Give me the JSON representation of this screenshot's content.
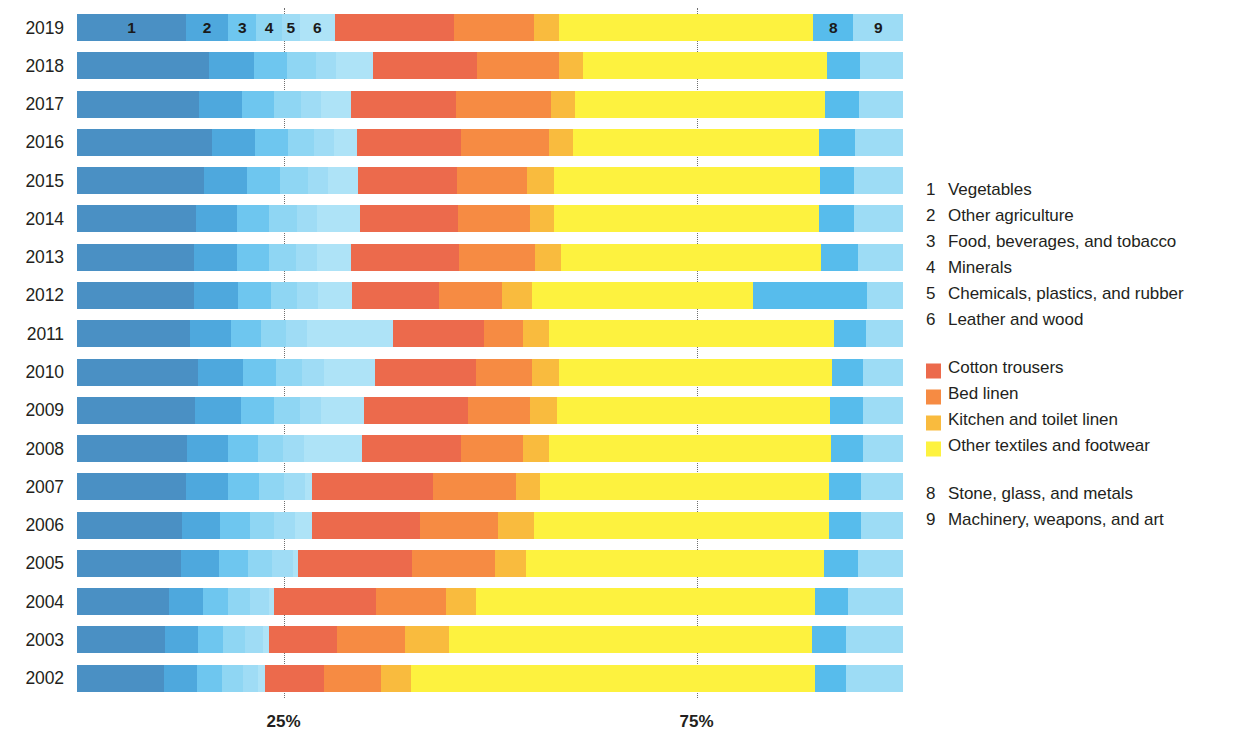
{
  "chart_data": {
    "type": "bar",
    "subtype": "stacked-horizontal-100pct",
    "title": "",
    "subtitle": "",
    "xlabel": "",
    "ylabel": "",
    "xlim": [
      0,
      100
    ],
    "xticks": [
      25,
      75
    ],
    "xtick_labels": [
      "25%",
      "75%"
    ],
    "grid": "vertical dotted gridlines at 25% and 75%",
    "legend_position": "right",
    "orientation": "horizontal",
    "categories": [
      "2019",
      "2018",
      "2017",
      "2016",
      "2015",
      "2014",
      "2013",
      "2012",
      "2011",
      "2010",
      "2009",
      "2008",
      "2007",
      "2006",
      "2005",
      "2004",
      "2003",
      "2002"
    ],
    "series": [
      {
        "name": "Vegetables",
        "key": "1",
        "color": "#4a90c4",
        "values": [
          13.0,
          15.5,
          14.0,
          16.0,
          15.0,
          14.0,
          14.0,
          14.0,
          13.5,
          14.5,
          14.0,
          13.0,
          13.0,
          12.5,
          12.5,
          11.0,
          10.5,
          10.5
        ]
      },
      {
        "name": "Other agriculture",
        "key": "2",
        "color": "#4ea8dd",
        "values": [
          5.0,
          5.5,
          5.0,
          5.5,
          5.5,
          5.0,
          5.0,
          5.5,
          5.0,
          5.5,
          5.5,
          5.0,
          5.0,
          4.5,
          4.5,
          4.0,
          4.0,
          4.0
        ]
      },
      {
        "name": "Food, beverages, and tobacco",
        "key": "3",
        "color": "#6ec6ef",
        "values": [
          3.5,
          4.0,
          4.0,
          4.0,
          4.0,
          4.0,
          4.0,
          4.0,
          3.5,
          4.0,
          4.0,
          3.5,
          3.5,
          3.5,
          3.5,
          3.0,
          3.0,
          3.0
        ]
      },
      {
        "name": "Minerals",
        "key": "4",
        "color": "#8fd6f3"
      },
      {
        "name": "Chemicals, plastics, and rubber",
        "key": "5",
        "color": "#9fdcf5"
      },
      {
        "name": "Leather and wood",
        "key": "6",
        "color": "#aee3f7"
      },
      {
        "name": "Cotton trousers",
        "key": "7a",
        "color": "#ec6a4c"
      },
      {
        "name": "Bed linen",
        "key": "7b",
        "color": "#f68b43"
      },
      {
        "name": "Kitchen and toilet linen",
        "key": "7c",
        "color": "#f9bb3e"
      },
      {
        "name": "Other textiles and footwear",
        "key": "7d",
        "color": "#fdf23f"
      },
      {
        "name": "Stone, glass, and metals",
        "key": "8",
        "color": "#57bcec"
      },
      {
        "name": "Machinery, weapons, and art",
        "key": "9",
        "color": "#9ddcf5"
      }
    ],
    "rows": [
      {
        "year": "2019",
        "segments": [
          13.2,
          5.1,
          3.4,
          3.1,
          2.2,
          4.2,
          14.4,
          9.7,
          3.0,
          30.8,
          4.9,
          6.0
        ],
        "show_numbers": true
      },
      {
        "year": "2018",
        "segments": [
          16.0,
          5.4,
          4.0,
          3.5,
          2.5,
          4.4,
          12.6,
          9.9,
          3.0,
          29.5,
          4.0,
          5.2
        ],
        "show_numbers": false
      },
      {
        "year": "2017",
        "segments": [
          14.8,
          5.2,
          3.8,
          3.3,
          2.5,
          3.6,
          12.7,
          11.5,
          2.9,
          30.2,
          4.2,
          5.3
        ],
        "show_numbers": false
      },
      {
        "year": "2016",
        "segments": [
          16.3,
          5.3,
          3.9,
          3.2,
          2.4,
          2.8,
          12.6,
          10.6,
          2.9,
          29.8,
          4.4,
          5.8
        ],
        "show_numbers": false
      },
      {
        "year": "2015",
        "segments": [
          15.4,
          5.2,
          4.0,
          3.4,
          2.4,
          3.6,
          12.0,
          8.5,
          3.2,
          32.2,
          4.2,
          5.9
        ],
        "show_numbers": false
      },
      {
        "year": "2014",
        "segments": [
          14.4,
          5.0,
          3.9,
          3.3,
          2.5,
          5.2,
          11.8,
          8.8,
          2.8,
          32.1,
          4.3,
          5.9
        ],
        "show_numbers": false
      },
      {
        "year": "2013",
        "segments": [
          14.2,
          5.2,
          3.9,
          3.2,
          2.6,
          4.1,
          13.1,
          9.1,
          3.2,
          31.5,
          4.4,
          5.5
        ],
        "show_numbers": false
      },
      {
        "year": "2012",
        "segments": [
          14.2,
          5.3,
          4.0,
          3.1,
          2.6,
          4.1,
          10.5,
          7.7,
          3.6,
          26.7,
          13.9,
          4.3
        ],
        "show_numbers": false
      },
      {
        "year": "2011",
        "segments": [
          13.7,
          5.0,
          3.6,
          3.0,
          2.6,
          10.3,
          11.1,
          4.7,
          3.2,
          34.5,
          3.8,
          4.5
        ],
        "show_numbers": false
      },
      {
        "year": "2010",
        "segments": [
          14.7,
          5.4,
          4.0,
          3.1,
          2.7,
          6.2,
          12.2,
          6.8,
          3.2,
          33.1,
          3.7,
          4.9
        ],
        "show_numbers": false
      },
      {
        "year": "2009",
        "segments": [
          14.3,
          5.5,
          4.0,
          3.2,
          2.6,
          5.1,
          12.6,
          7.5,
          3.3,
          33.1,
          3.9,
          4.9
        ],
        "show_numbers": false
      },
      {
        "year": "2008",
        "segments": [
          13.3,
          5.0,
          3.6,
          3.0,
          2.6,
          7.0,
          12.0,
          7.5,
          3.2,
          34.1,
          3.8,
          4.9
        ],
        "show_numbers": false
      },
      {
        "year": "2007",
        "segments": [
          13.2,
          5.1,
          3.7,
          3.0,
          2.6,
          0.9,
          14.6,
          10.0,
          3.0,
          35.0,
          3.8,
          5.1
        ],
        "show_numbers": false
      },
      {
        "year": "2006",
        "segments": [
          12.7,
          4.6,
          3.6,
          3.0,
          2.5,
          2.1,
          13.0,
          9.5,
          4.3,
          35.8,
          3.8,
          5.1
        ],
        "show_numbers": false
      },
      {
        "year": "2005",
        "segments": [
          12.6,
          4.6,
          3.5,
          2.9,
          2.5,
          0.6,
          13.8,
          10.1,
          3.8,
          36.0,
          4.1,
          5.5
        ],
        "show_numbers": false
      },
      {
        "year": "2004",
        "segments": [
          11.1,
          4.1,
          3.1,
          2.6,
          2.3,
          0.6,
          12.4,
          8.5,
          3.6,
          41.0,
          4.1,
          6.6
        ],
        "show_numbers": false
      },
      {
        "year": "2003",
        "segments": [
          10.6,
          4.0,
          3.1,
          2.6,
          2.2,
          0.7,
          8.3,
          8.2,
          5.3,
          44.0,
          4.1,
          6.9
        ],
        "show_numbers": false
      },
      {
        "year": "2002",
        "segments": [
          10.5,
          4.0,
          3.1,
          2.5,
          1.8,
          0.8,
          7.2,
          6.9,
          3.6,
          49.0,
          3.7,
          6.9
        ],
        "show_numbers": false
      }
    ]
  },
  "axis": {
    "ticks": [
      {
        "label": "25%",
        "value": 25
      },
      {
        "label": "75%",
        "value": 75
      }
    ]
  },
  "bar_numbers": [
    {
      "label": "1",
      "segment_index": 0
    },
    {
      "label": "2",
      "segment_index": 1
    },
    {
      "label": "3",
      "segment_index": 2
    },
    {
      "label": "4",
      "segment_index": 3
    },
    {
      "label": "5",
      "segment_index": 4
    },
    {
      "label": "6",
      "segment_index": 5
    },
    {
      "label": "8",
      "segment_index": 10
    },
    {
      "label": "9",
      "segment_index": 11
    }
  ],
  "legend": {
    "numbered_top": [
      {
        "key": "1",
        "label": "Vegetables"
      },
      {
        "key": "2",
        "label": "Other agriculture"
      },
      {
        "key": "3",
        "label": "Food, beverages, and tobacco"
      },
      {
        "key": "4",
        "label": "Minerals"
      },
      {
        "key": "5",
        "label": "Chemicals, plastics, and rubber"
      },
      {
        "key": "6",
        "label": "Leather and wood"
      }
    ],
    "swatches": [
      {
        "label": "Cotton trousers",
        "color": "#ec6a4c"
      },
      {
        "label": "Bed linen",
        "color": "#f68b43"
      },
      {
        "label": "Kitchen and toilet linen",
        "color": "#f9bb3e"
      },
      {
        "label": "Other textiles and footwear",
        "color": "#fdf23f"
      }
    ],
    "numbered_bottom": [
      {
        "key": "8",
        "label": "Stone, glass, and metals"
      },
      {
        "key": "9",
        "label": "Machinery, weapons, and art"
      }
    ]
  }
}
